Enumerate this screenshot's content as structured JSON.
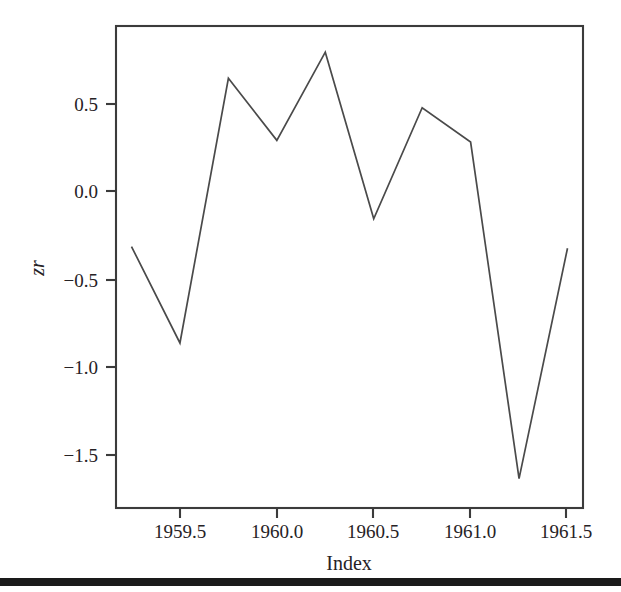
{
  "figure": {
    "background_color": "#ffffff",
    "line_color": "#4a4a4a",
    "frame_color": "#3b3b3b",
    "text_color": "#262225"
  },
  "axes": {
    "x_title": "Index",
    "y_title": "zr",
    "x_tick_labels": [
      "1959.5",
      "1960.0",
      "1960.5",
      "1961.0",
      "1961.5"
    ],
    "y_tick_labels": [
      "0.5",
      "0.0",
      "−0.5",
      "−1.0",
      "−1.5"
    ]
  },
  "page_edge": {
    "label": "scan-page-edge-bar",
    "color": "#1a1a1a",
    "top": 578,
    "height": 8
  },
  "chart_data": {
    "type": "line",
    "title": "",
    "subtitle": "",
    "xlabel": "Index",
    "ylabel": "zr",
    "x": [
      1959.25,
      1959.5,
      1959.75,
      1960.0,
      1960.25,
      1960.5,
      1960.75,
      1961.0,
      1961.25,
      1961.5
    ],
    "values": [
      -0.34,
      -0.93,
      0.69,
      0.31,
      0.85,
      -0.17,
      0.51,
      0.3,
      -1.76,
      -0.35
    ],
    "series": [
      {
        "name": "zr",
        "values": [
          -0.34,
          -0.93,
          0.69,
          0.31,
          0.85,
          -0.17,
          0.51,
          0.3,
          -1.76,
          -0.35
        ]
      }
    ],
    "xticks": [
      1959.5,
      1960.0,
      1960.5,
      1961.0,
      1961.5
    ],
    "xtick_labels": [
      "1959.5",
      "1960.0",
      "1960.5",
      "1961.0",
      "1961.5"
    ],
    "yticks": [
      0.5,
      0.0,
      -0.5,
      -1.0,
      -1.5
    ],
    "ytick_labels": [
      "0.5",
      "0.0",
      "−0.5",
      "−1.0",
      "−1.5"
    ],
    "xlim": [
      1959.17,
      1961.58
    ],
    "ylim": [
      -1.94,
      1.01
    ],
    "grid": false,
    "legend": null,
    "annotations": []
  }
}
